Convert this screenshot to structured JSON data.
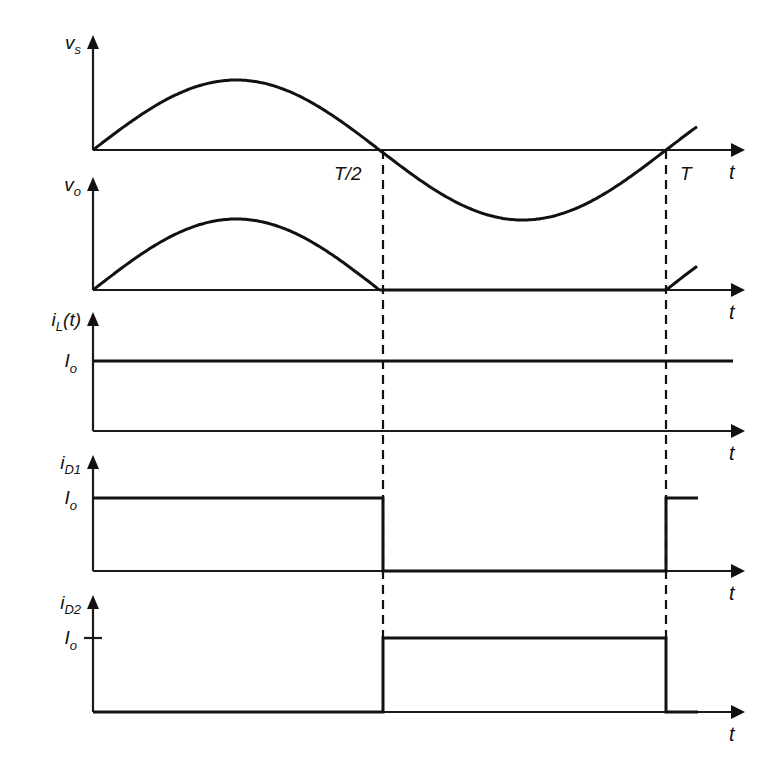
{
  "diagram": {
    "title": "",
    "colors": {
      "line": "#111111",
      "background": "#ffffff"
    },
    "time_markers": [
      {
        "label": "T/2",
        "x": 383
      },
      {
        "label": "T",
        "x": 666
      }
    ],
    "axis_x": 93,
    "axis_end_x": 745,
    "time_axis_label": "t",
    "plots": [
      {
        "id": "vs",
        "y_label": "v",
        "y_label_sub": "s",
        "level_label": "",
        "baseline": 150,
        "top": 35,
        "waveform": "full-sine",
        "amplitude": 70
      },
      {
        "id": "vo",
        "y_label": "v",
        "y_label_sub": "o",
        "level_label": "",
        "baseline": 290,
        "top": 177,
        "waveform": "half-sine",
        "amplitude": 71
      },
      {
        "id": "iL",
        "y_label": "i",
        "y_label_sub": "L",
        "y_label_suffix": "(t)",
        "level_label": "I",
        "level_label_sub": "o",
        "baseline": 431,
        "top": 312,
        "level": 361,
        "waveform": "constant"
      },
      {
        "id": "iD1",
        "y_label": "i",
        "y_label_sub": "D1",
        "level_label": "I",
        "level_label_sub": "o",
        "baseline": 571,
        "top": 455,
        "level": 498,
        "waveform": "pulse-first-half"
      },
      {
        "id": "iD2",
        "y_label": "i",
        "y_label_sub": "D2",
        "level_label": "I",
        "level_label_sub": "o",
        "baseline": 712,
        "top": 595,
        "level": 638,
        "waveform": "pulse-second-half",
        "has_tick": true
      }
    ]
  }
}
